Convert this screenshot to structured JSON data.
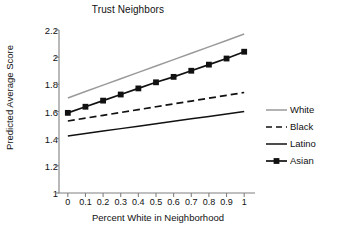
{
  "chart_data": {
    "type": "line",
    "title": "Trust Neighbors",
    "xlabel": "Percent White in Neighborhood",
    "ylabel": "Predicted Average Score",
    "xlim": [
      -0.05,
      1.05
    ],
    "ylim": [
      1.0,
      2.2
    ],
    "grid": false,
    "legend_position": "right",
    "xticks": [
      "0",
      "0.1",
      "0.2",
      "0.3",
      "0.4",
      "0.5",
      "0.6",
      "0.7",
      "0.8",
      "0.9",
      "1"
    ],
    "xtick_values": [
      0,
      0.1,
      0.2,
      0.3,
      0.4,
      0.5,
      0.6,
      0.7,
      0.8,
      0.9,
      1
    ],
    "yticks": [
      "1",
      "1.2",
      "1.4",
      "1.6",
      "1.8",
      "2",
      "2.2"
    ],
    "ytick_values": [
      1,
      1.2,
      1.4,
      1.6,
      1.8,
      2,
      2.2
    ],
    "x": [
      0,
      0.1,
      0.2,
      0.3,
      0.4,
      0.5,
      0.6,
      0.7,
      0.8,
      0.9,
      1
    ],
    "series": [
      {
        "name": "White",
        "color": "#9a9a9a",
        "style": "solid",
        "marker": "none",
        "values": [
          1.7,
          1.747,
          1.794,
          1.841,
          1.888,
          1.935,
          1.982,
          2.029,
          2.076,
          2.123,
          2.17
        ]
      },
      {
        "name": "Black",
        "color": "#111111",
        "style": "dashed",
        "marker": "none",
        "values": [
          1.53,
          1.551,
          1.572,
          1.593,
          1.614,
          1.635,
          1.656,
          1.677,
          1.698,
          1.719,
          1.74
        ]
      },
      {
        "name": "Latino",
        "color": "#111111",
        "style": "solid",
        "marker": "none",
        "values": [
          1.42,
          1.438,
          1.456,
          1.474,
          1.492,
          1.51,
          1.528,
          1.546,
          1.564,
          1.582,
          1.6
        ]
      },
      {
        "name": "Asian",
        "color": "#111111",
        "style": "solid",
        "marker": "square",
        "values": [
          1.59,
          1.635,
          1.68,
          1.725,
          1.77,
          1.815,
          1.855,
          1.9,
          1.945,
          1.99,
          2.04
        ]
      }
    ]
  },
  "legend": {
    "items": [
      {
        "label": "White"
      },
      {
        "label": "Black"
      },
      {
        "label": "Latino"
      },
      {
        "label": "Asian"
      }
    ]
  }
}
